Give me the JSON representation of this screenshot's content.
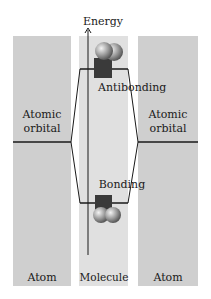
{
  "axis": {
    "label": "Energy"
  },
  "panels": {
    "left": {
      "title": "Atom",
      "orbital_label_line1": "Atomic",
      "orbital_label_line2": "orbital"
    },
    "middle": {
      "title": "Molecule",
      "antibonding_label": "Antibonding",
      "bonding_label": "Bonding"
    },
    "right": {
      "title": "Atom",
      "orbital_label_line1": "Atomic",
      "orbital_label_line2": "orbital"
    }
  },
  "colors": {
    "atom_panel": "#cfcfcf",
    "molecule_panel": "#e0e0e0",
    "line": "#1a1a1a",
    "block": "#3a3a3a"
  }
}
